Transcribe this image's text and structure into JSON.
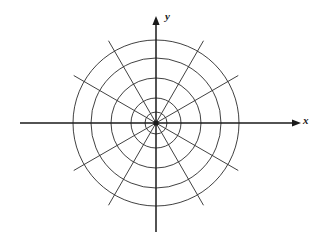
{
  "figure": {
    "name": "polar-coordinate-grid",
    "title": "",
    "background_color": "#ffffff",
    "line_color": "#2b2b2b",
    "axis_color": "#1a1a1a"
  },
  "axes": {
    "x_label": "x",
    "y_label": "y",
    "x_axis": {
      "x1": 20,
      "y1": 123,
      "x2": 301,
      "y2": 123,
      "arrow": "right"
    },
    "y_axis": {
      "x1": 156,
      "y1": 232,
      "x2": 156,
      "y2": 16,
      "arrow": "up"
    }
  },
  "chart_data": {
    "type": "polar-grid",
    "title": "",
    "xlabel": "x",
    "ylabel": "y",
    "grid": true,
    "legend": "none",
    "center": {
      "x": 156,
      "y": 123
    },
    "circle_radii": [
      11,
      25,
      45,
      65,
      83
    ],
    "circle_count": 5,
    "spoke_angles_deg": [
      0,
      30,
      60,
      90,
      120,
      150,
      180,
      210,
      240,
      270,
      300,
      330
    ],
    "spoke_count": 12,
    "spoke_spacing_deg": 30,
    "spoke_radius": 95,
    "axis_ranges": {
      "x": [
        -136,
        145
      ],
      "y": [
        -109,
        107
      ]
    }
  }
}
